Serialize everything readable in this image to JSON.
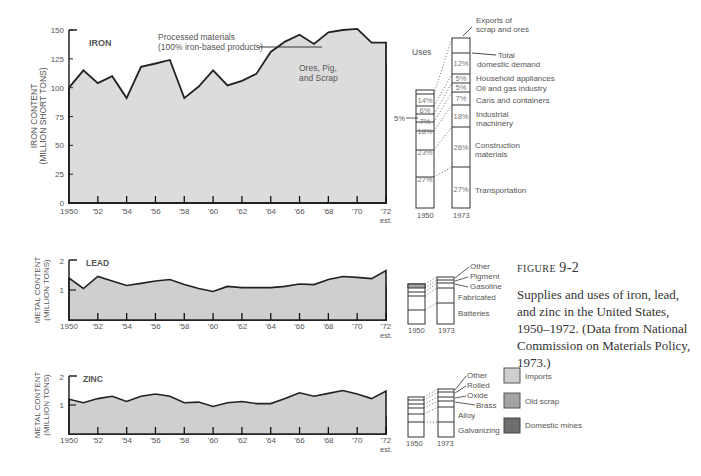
{
  "colors": {
    "imports": "#cfcfcf",
    "old_scrap": "#a3a3a3",
    "domestic_mines": "#6e6e6e",
    "processed": "#dcdcdc",
    "line": "#222222"
  },
  "caption": {
    "figure_label": "FIGURE",
    "figure_number": "9-2",
    "text": "Supplies and uses of iron, lead, and zinc in the United States, 1950–1972. (Data from National Commission on Materials Policy, 1973.)"
  },
  "legend": {
    "items": [
      {
        "label": "Imports",
        "color": "#cfcfcf"
      },
      {
        "label": "Old scrap",
        "color": "#a3a3a3"
      },
      {
        "label": "Domestic mines",
        "color": "#6e6e6e"
      }
    ]
  },
  "chart_data": [
    {
      "type": "area",
      "title": "IRON",
      "ylabel": "IRON CONTENT (MILLION SHORT TONS)",
      "xlabel": "",
      "ylim": [
        0,
        150
      ],
      "yticks": [
        0,
        25,
        50,
        75,
        100,
        125,
        150
      ],
      "x": [
        1950,
        1951,
        1952,
        1953,
        1954,
        1955,
        1956,
        1957,
        1958,
        1959,
        1960,
        1961,
        1962,
        1963,
        1964,
        1965,
        1966,
        1967,
        1968,
        1969,
        1970,
        1971,
        1972
      ],
      "xtick_labels": [
        "1950",
        "'52",
        "'54",
        "'56",
        "'58",
        "'60",
        "'62",
        "'64",
        "'66",
        "'68",
        "'70",
        "'72 est."
      ],
      "stacked_totals": true,
      "series": [
        {
          "name": "Domestic mines",
          "values": [
            53,
            65,
            53,
            68,
            43,
            58,
            54,
            60,
            41,
            36,
            54,
            42,
            42,
            44,
            52,
            56,
            57,
            54,
            55,
            57,
            58,
            55,
            51
          ]
        },
        {
          "name": "Old scrap",
          "values": [
            88,
            102,
            92,
            101,
            73,
            99,
            99,
            98,
            69,
            69,
            86,
            80,
            74,
            81,
            91,
            97,
            99,
            96,
            97,
            103,
            104,
            93,
            98
          ]
        },
        {
          "name": "Imports (Ores, Pig, and Scrap)",
          "values": [
            95,
            106,
            97,
            106,
            80,
            116,
            118,
            119,
            86,
            94,
            106,
            97,
            97,
            104,
            124,
            126,
            132,
            126,
            127,
            133,
            135,
            121,
            121
          ]
        },
        {
          "name": "Processed materials (100% iron-based products)",
          "values": [
            100,
            115,
            104,
            110,
            91,
            118,
            121,
            124,
            91,
            101,
            115,
            102,
            106,
            112,
            131,
            140,
            146,
            138,
            148,
            150,
            151,
            139,
            139
          ]
        }
      ],
      "annotations": [
        "Processed materials (100% iron-based products)",
        "Ores, Pig, and Scrap"
      ]
    },
    {
      "type": "bar",
      "title": "Iron Uses",
      "stacked": true,
      "categories": [
        "1950",
        "1973"
      ],
      "segments_bottom_to_top": [
        "Transportation",
        "Construction materials",
        "Industrial machinery",
        "Cans and containers",
        "Oil and gas industry",
        "Household appliances",
        "Total domestic demand (other)",
        "Exports of scrap and ores"
      ],
      "series": [
        {
          "name": "1950",
          "values_pct": [
            27,
            23,
            18,
            7,
            5,
            6,
            14
          ]
        },
        {
          "name": "1973",
          "values_pct": [
            27,
            26,
            18,
            7,
            5,
            5,
            12
          ]
        }
      ],
      "labels": [
        "Uses",
        "Exports of scrap and ores",
        "Total domestic demand",
        "Household appliances",
        "Oil and gas industry",
        "Cans and containers",
        "Industrial machinery",
        "Construction materials",
        "Transportation"
      ],
      "callout": "5%"
    },
    {
      "type": "area",
      "title": "LEAD",
      "ylabel": "METAL CONTENT (MILLION TONS)",
      "ylim": [
        0,
        2
      ],
      "yticks": [
        1,
        2
      ],
      "x": [
        1950,
        1951,
        1952,
        1953,
        1954,
        1955,
        1956,
        1957,
        1958,
        1959,
        1960,
        1961,
        1962,
        1963,
        1964,
        1965,
        1966,
        1967,
        1968,
        1969,
        1970,
        1971,
        1972
      ],
      "series": [
        {
          "name": "Domestic mines",
          "values": [
            0.45,
            0.35,
            0.4,
            0.38,
            0.35,
            0.38,
            0.45,
            0.4,
            0.25,
            0.2,
            0.28,
            0.32,
            0.32,
            0.28,
            0.25,
            0.32,
            0.33,
            0.28,
            0.42,
            0.5,
            0.55,
            0.55,
            0.52
          ]
        },
        {
          "name": "Old scrap",
          "values": [
            0.82,
            0.78,
            0.8,
            0.82,
            0.75,
            0.75,
            0.85,
            0.78,
            0.68,
            0.63,
            0.63,
            0.68,
            0.72,
            0.72,
            0.7,
            0.68,
            0.68,
            0.68,
            0.8,
            1.0,
            1.02,
            1.05,
            1.12
          ]
        },
        {
          "name": "Imports",
          "values": [
            1.4,
            1.05,
            1.45,
            1.3,
            1.15,
            1.22,
            1.3,
            1.35,
            1.18,
            1.05,
            0.95,
            1.12,
            1.08,
            1.08,
            1.08,
            1.12,
            1.2,
            1.18,
            1.35,
            1.45,
            1.42,
            1.38,
            1.65
          ]
        }
      ]
    },
    {
      "type": "bar",
      "title": "Lead Uses",
      "stacked": true,
      "categories": [
        "1950",
        "1973"
      ],
      "segments_bottom_to_top": [
        "Batteries",
        "Fabricated",
        "Gasoline",
        "Pigment",
        "Other"
      ]
    },
    {
      "type": "area",
      "title": "ZINC",
      "ylabel": "METAL CONTENT (MILLION TONS)",
      "ylim": [
        0,
        2
      ],
      "yticks": [
        1,
        2
      ],
      "x": [
        1950,
        1951,
        1952,
        1953,
        1954,
        1955,
        1956,
        1957,
        1958,
        1959,
        1960,
        1961,
        1962,
        1963,
        1964,
        1965,
        1966,
        1967,
        1968,
        1969,
        1970,
        1971,
        1972
      ],
      "series": [
        {
          "name": "Domestic mines",
          "values": [
            0.65,
            0.7,
            0.65,
            0.55,
            0.5,
            0.52,
            0.55,
            0.52,
            0.45,
            0.42,
            0.42,
            0.42,
            0.45,
            0.48,
            0.5,
            0.5,
            0.48,
            0.47,
            0.47,
            0.5,
            0.48,
            0.45,
            0.4
          ]
        },
        {
          "name": "Old scrap",
          "values": [
            0.8,
            0.82,
            0.78,
            0.7,
            0.6,
            0.62,
            0.68,
            0.65,
            0.58,
            0.52,
            0.52,
            0.52,
            0.58,
            0.6,
            0.62,
            0.65,
            0.62,
            0.6,
            0.62,
            0.65,
            0.65,
            0.62,
            0.58
          ]
        },
        {
          "name": "Imports",
          "values": [
            1.2,
            1.08,
            1.22,
            1.3,
            1.12,
            1.3,
            1.38,
            1.3,
            1.08,
            1.1,
            0.95,
            1.08,
            1.12,
            1.05,
            1.05,
            1.22,
            1.42,
            1.3,
            1.4,
            1.5,
            1.38,
            1.22,
            1.48
          ]
        }
      ]
    },
    {
      "type": "bar",
      "title": "Zinc Uses",
      "stacked": true,
      "categories": [
        "1950",
        "1973"
      ],
      "segments_bottom_to_top": [
        "Galvanizing",
        "Alloy",
        "Brass",
        "Oxide",
        "Rolled",
        "Other"
      ]
    }
  ],
  "iron": {
    "title": "IRON",
    "ylabel1": "IRON CONTENT",
    "ylabel2": "(MILLION SHORT TONS)",
    "yticks": [
      "0",
      "25",
      "50",
      "75",
      "100",
      "125",
      "150"
    ],
    "xticks": [
      "1950",
      "'52",
      "'54",
      "'56",
      "'58",
      "'60",
      "'62",
      "'64",
      "'66",
      "'68",
      "'70",
      "'72"
    ],
    "x_est": "est.",
    "ann_processed_1": "Processed materials",
    "ann_processed_2": "(100% iron-based products)",
    "ann_ores_1": "Ores, Pig,",
    "ann_ores_2": "and Scrap",
    "uses": {
      "title": "Uses",
      "callout": "5%",
      "years": [
        "1950",
        "1973"
      ],
      "pct1950": [
        "27%",
        "23%",
        "18%",
        "7%",
        "6%",
        "14%"
      ],
      "pct1973": [
        "27%",
        "26%",
        "18%",
        "7%",
        "5%",
        "5%",
        "12%"
      ],
      "labels": {
        "exports1": "Exports of",
        "exports2": "scrap and ores",
        "total1": "Total",
        "total2": "domestic demand",
        "household": "Household appliances",
        "oilgas": "Oil and gas industry",
        "cans": "Cans and containers",
        "industrial1": "Industrial",
        "industrial2": "machinery",
        "construction1": "Construction",
        "construction2": "materials",
        "transport": "Transportation"
      }
    }
  },
  "lead": {
    "title": "LEAD",
    "ylabel1": "METAL CONTENT",
    "ylabel2": "(MILLION TONS)",
    "yticks": [
      "1",
      "2"
    ],
    "uses": {
      "years": [
        "1950",
        "1973"
      ],
      "labels": {
        "other": "Other",
        "pigment": "Pigment",
        "gasoline": "Gasoline",
        "fabricated": "Fabricated",
        "batteries": "Batteries"
      }
    }
  },
  "zinc": {
    "title": "ZINC",
    "ylabel1": "METAL CONTENT",
    "ylabel2": "(MILLION TONS)",
    "yticks": [
      "1",
      "2"
    ],
    "uses": {
      "years": [
        "1950",
        "1973"
      ],
      "labels": {
        "other": "Other",
        "rolled": "Rolled",
        "oxide": "Oxide",
        "brass": "Brass",
        "alloy": "Alloy",
        "galvanizing": "Galvanizing"
      }
    }
  }
}
